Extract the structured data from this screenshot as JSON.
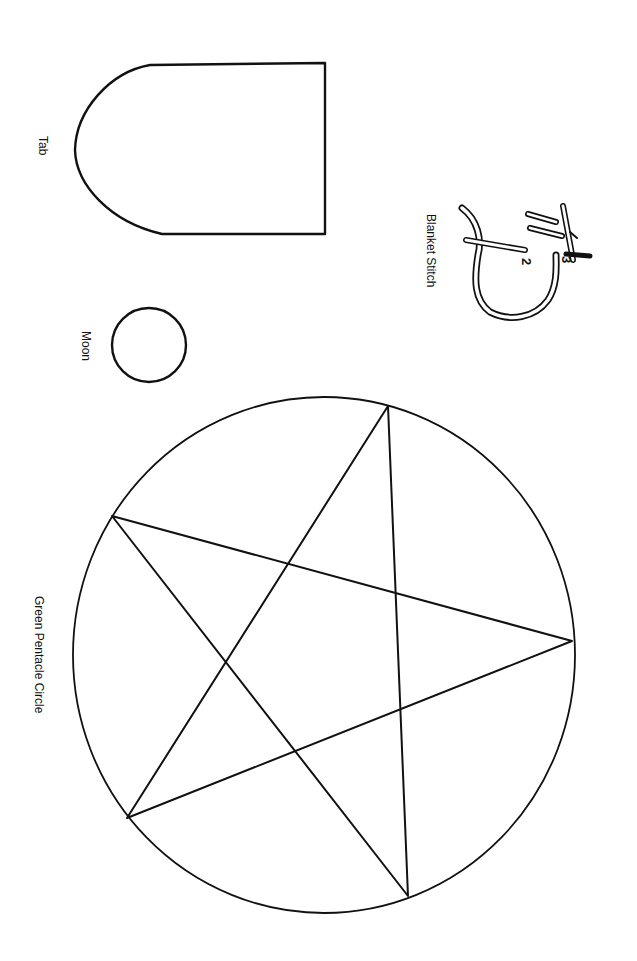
{
  "page": {
    "background": "#ffffff",
    "ink": "#111111"
  },
  "labels": {
    "tab": "Tab",
    "moon": "Moon",
    "blanket_stitch": "Blanket Stitch",
    "pentacle": "Green Pentacle Circle"
  },
  "stitch_numbers": {
    "two": "2",
    "three": "3"
  },
  "shapes": {
    "tab": {
      "type": "rounded-tab",
      "x_left": 75,
      "x_right": 325,
      "y_top": 63,
      "y_bottom": 234
    },
    "moon": {
      "type": "circle",
      "cx": 149,
      "cy": 345,
      "r": 37
    },
    "pentacle": {
      "circle": {
        "cx": 324,
        "cy": 655,
        "r": 250
      },
      "vertices": [
        [
          388,
          406
        ],
        [
          112,
          516
        ],
        [
          127,
          818
        ],
        [
          408,
          896
        ],
        [
          572,
          641
        ]
      ]
    }
  }
}
